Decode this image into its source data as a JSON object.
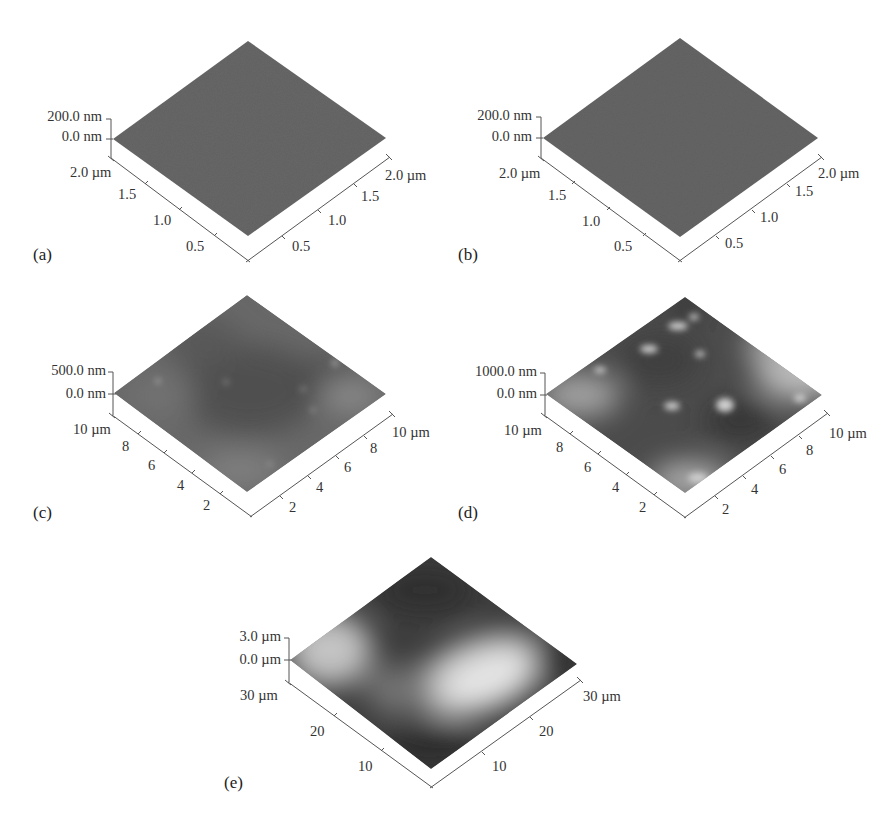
{
  "figure": {
    "panels": [
      {
        "id": "a",
        "label": "(a)",
        "z_top": "200.0 nm",
        "z_bottom": "0.0 nm",
        "left_axis_ticks": [
          "2.0 µm",
          "1.5",
          "1.0",
          "0.5"
        ],
        "right_axis_ticks": [
          "2.0 µm",
          "1.5",
          "1.0",
          "0.5"
        ],
        "surface": "flat-uniform-gray"
      },
      {
        "id": "b",
        "label": "(b)",
        "z_top": "200.0 nm",
        "z_bottom": "0.0 nm",
        "left_axis_ticks": [
          "2.0 µm",
          "1.5",
          "1.0",
          "0.5"
        ],
        "right_axis_ticks": [
          "2.0 µm",
          "1.5",
          "1.0",
          "0.5"
        ],
        "surface": "flat-uniform-gray"
      },
      {
        "id": "c",
        "label": "(c)",
        "z_top": "500.0 nm",
        "z_bottom": "0.0 nm",
        "left_axis_ticks": [
          "10 µm",
          "8",
          "6",
          "4",
          "2"
        ],
        "right_axis_ticks": [
          "10 µm",
          "8",
          "6",
          "4",
          "2"
        ],
        "surface": "mottled-gray-with-light-spots"
      },
      {
        "id": "d",
        "label": "(d)",
        "z_top": "1000.0 nm",
        "z_bottom": "0.0 nm",
        "left_axis_ticks": [
          "10 µm",
          "8",
          "6",
          "4",
          "2"
        ],
        "right_axis_ticks": [
          "10 µm",
          "8",
          "6",
          "4",
          "2"
        ],
        "surface": "rough-dark-with-bright-clusters"
      },
      {
        "id": "e",
        "label": "(e)",
        "z_top": "3.0 µm",
        "z_bottom": "0.0 µm",
        "left_axis_ticks": [
          "30 µm",
          "20",
          "10"
        ],
        "right_axis_ticks": [
          "30 µm",
          "20",
          "10"
        ],
        "surface": "dark-with-two-large-bright-mounds"
      }
    ]
  },
  "colors": {
    "surface_flat": "#666666",
    "surface_mid": "#5a5a5a",
    "dark": "#2a2a2a",
    "bright": "#f2f2f2",
    "axis": "#555555"
  }
}
